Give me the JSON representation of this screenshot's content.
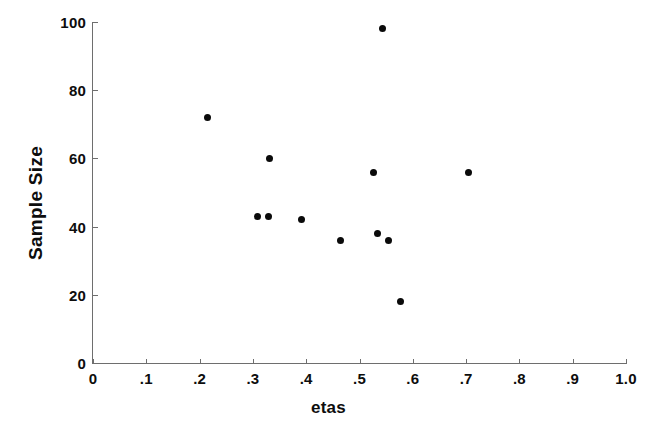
{
  "chart_data": {
    "type": "scatter",
    "title": "",
    "xlabel": "etas",
    "ylabel": "Sample Size",
    "xlim": [
      0,
      1.0
    ],
    "ylim": [
      0,
      100
    ],
    "grid": false,
    "legend": null,
    "marker": {
      "shape": "circle",
      "color": "#0a0a0a",
      "size": 7
    },
    "axis_color": "#6e6e6e",
    "background": "#ffffff",
    "xticks": [
      0,
      0.1,
      0.2,
      0.3,
      0.4,
      0.5,
      0.6,
      0.7,
      0.8,
      0.9,
      1.0
    ],
    "xtick_labels": [
      "0",
      ".1",
      ".2",
      ".3",
      ".4",
      ".5",
      ".6",
      ".7",
      ".8",
      ".9",
      "1.0"
    ],
    "yticks": [
      0,
      20,
      40,
      60,
      80,
      100
    ],
    "ytick_labels": [
      "0",
      "20",
      "40",
      "60",
      "80",
      "100"
    ],
    "points": [
      {
        "x": 0.215,
        "y": 72
      },
      {
        "x": 0.308,
        "y": 43
      },
      {
        "x": 0.33,
        "y": 43
      },
      {
        "x": 0.332,
        "y": 60
      },
      {
        "x": 0.392,
        "y": 42
      },
      {
        "x": 0.464,
        "y": 36
      },
      {
        "x": 0.526,
        "y": 56
      },
      {
        "x": 0.533,
        "y": 38
      },
      {
        "x": 0.544,
        "y": 98
      },
      {
        "x": 0.555,
        "y": 36
      },
      {
        "x": 0.576,
        "y": 18
      },
      {
        "x": 0.704,
        "y": 56
      }
    ]
  }
}
